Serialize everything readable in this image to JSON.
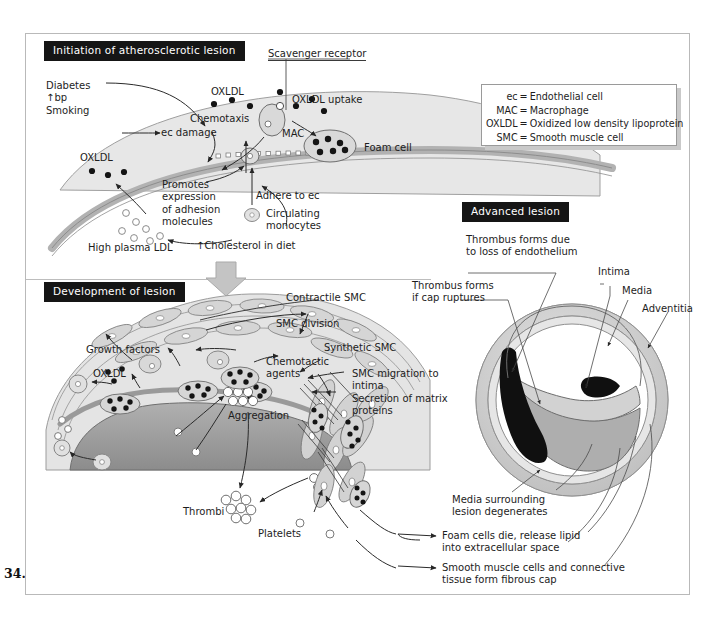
{
  "figure": {
    "number": "34.1",
    "colors": {
      "banner_bg": "#151515",
      "banner_text": "#ffffff",
      "frame_border": "#b9b9b9",
      "vessel_wall": "#b8b8b8",
      "intima_fill": "#d8d8d8",
      "lipid_core": "#8f8f8f",
      "thrombus": "#111111",
      "lumen": "#ffffff",
      "cell_fill": "#cfcfcf",
      "arrow": "#2b2b2b",
      "big_arrow": "#c4c4c4"
    }
  },
  "panels": {
    "initiation": {
      "banner": "Initiation of atherosclerotic lesion",
      "labels": {
        "risk_factors": "Diabetes\n↑bp\nSmoking",
        "ec_damage": "ec damage",
        "oxldl_top": "OXLDL",
        "chemotaxis": "Chemotaxis",
        "scavenger_receptor": "Scavenger receptor",
        "oxldl_uptake": "OXLDL uptake",
        "mac": "MAC",
        "foam_cell": "Foam cell",
        "oxldl_left": "OXLDL",
        "promotes": "Promotes\nexpression\nof adhesion\nmolecules",
        "adhere_to_ec": "Adhere to ec",
        "circulating_monocytes": "Circulating\nmonocytes",
        "high_plasma_ldl": "High plasma LDL",
        "cholesterol_in_diet": "↑Cholesterol in diet"
      }
    },
    "development": {
      "banner": "Development of lesion",
      "labels": {
        "contractile_smc": "Contractile SMC",
        "smc_division": "SMC division",
        "synthetic_smc": "Synthetic SMC",
        "growth_factors": "Growth factors",
        "oxldl": "OXLDL",
        "chemotactic_agents": "Chemotactic\nagents",
        "smc_migration": "SMC migration to\nintima\nSecretion of matrix\nproteins",
        "aggregation": "Aggregation",
        "thrombi": "Thrombi",
        "platelets": "Platelets"
      }
    },
    "advanced": {
      "banner": "Advanced lesion",
      "labels": {
        "thrombus_endothelium": "Thrombus forms due\nto loss of endothelium",
        "thrombus_cap_ruptures": "Thrombus forms\nif cap ruptures",
        "intima": "Intima",
        "media": "Media",
        "adventitia": "Adventitia",
        "media_degenerates": "Media surrounding\nlesion degenerates",
        "foam_cells_die": "Foam cells die, release lipid\ninto extracellular space",
        "fibrous_cap": "Smooth muscle cells and connective\ntissue form fibrous cap"
      }
    }
  },
  "legend": {
    "rows": [
      {
        "key": "ec",
        "eq": "=",
        "value": "Endothelial cell"
      },
      {
        "key": "MAC",
        "eq": "=",
        "value": "Macrophage"
      },
      {
        "key": "OXLDL",
        "eq": "=",
        "value": "Oxidized low density lipoprotein"
      },
      {
        "key": "SMC",
        "eq": "=",
        "value": "Smooth muscle cell"
      }
    ]
  }
}
